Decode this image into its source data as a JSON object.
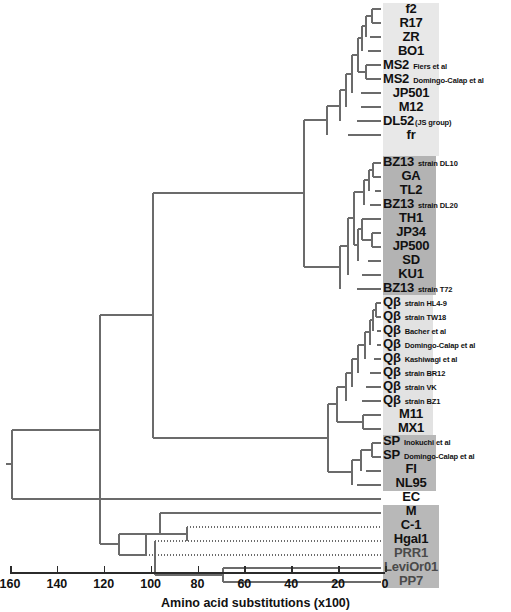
{
  "figure": {
    "type": "phylogenetic-tree-dendrogram",
    "background": "#ffffff",
    "branch_color": "#6b6b6b",
    "axis_color": "#2b2b2b"
  },
  "axis": {
    "title": "Amino acid substitutions (x100)",
    "ticks": [
      "160",
      "140",
      "120",
      "100",
      "80",
      "60",
      "40",
      "20",
      "0"
    ],
    "tick_values": [
      160,
      140,
      120,
      100,
      80,
      60,
      40,
      20,
      0
    ],
    "min": 0,
    "max": 160,
    "direction": "right-to-left",
    "px_left": 10,
    "px_right": 385
  },
  "groups": [
    {
      "id": "group-ms2",
      "shade": "#e8e8e8",
      "first_row": 0,
      "last_row": 10,
      "left": 383,
      "width": 56
    },
    {
      "id": "group-ga",
      "shade": "#b3b3b3",
      "first_row": 11,
      "last_row": 20,
      "left": 383,
      "width": 53
    },
    {
      "id": "group-qbeta",
      "shade": "#e2e2e2",
      "first_row": 21,
      "last_row": 30,
      "left": 383,
      "width": 50
    },
    {
      "id": "group-sp",
      "shade": "#b8b8b8",
      "first_row": 31,
      "last_row": 34,
      "left": 383,
      "width": 53
    },
    {
      "id": "group-misc",
      "shade": "#b8b8b8",
      "first_row": 36,
      "last_row": 41,
      "left": 383,
      "width": 56
    }
  ],
  "taxa": [
    {
      "name": "f2",
      "sub": ""
    },
    {
      "name": "R17",
      "sub": ""
    },
    {
      "name": "ZR",
      "sub": ""
    },
    {
      "name": "BO1",
      "sub": ""
    },
    {
      "name": "MS2",
      "sub": "Fiers et al"
    },
    {
      "name": "MS2",
      "sub": "Domingo-Calap et al"
    },
    {
      "name": "JP501",
      "sub": ""
    },
    {
      "name": "M12",
      "sub": ""
    },
    {
      "name": "DL52",
      "sub": "(JS group)"
    },
    {
      "name": "fr",
      "sub": ""
    },
    {
      "name": "",
      "sub": ""
    },
    {
      "name": "BZ13",
      "sub": "strain DL10"
    },
    {
      "name": "GA",
      "sub": ""
    },
    {
      "name": "TL2",
      "sub": ""
    },
    {
      "name": "BZ13",
      "sub": "strain DL20"
    },
    {
      "name": "TH1",
      "sub": ""
    },
    {
      "name": "JP34",
      "sub": ""
    },
    {
      "name": "JP500",
      "sub": ""
    },
    {
      "name": "SD",
      "sub": ""
    },
    {
      "name": "KU1",
      "sub": ""
    },
    {
      "name": "BZ13",
      "sub": "strain T72"
    },
    {
      "name": "Qβ",
      "sub": "strain HL4-9"
    },
    {
      "name": "Qβ",
      "sub": "strain TW18"
    },
    {
      "name": "Qβ",
      "sub": "Bacher et al"
    },
    {
      "name": "Qβ",
      "sub": "Domingo-Calap et al"
    },
    {
      "name": "Qβ",
      "sub": "Kashiwagi et al"
    },
    {
      "name": "Qβ",
      "sub": "strain BR12"
    },
    {
      "name": "Qβ",
      "sub": "strain VK"
    },
    {
      "name": "Qβ",
      "sub": "strain BZ1"
    },
    {
      "name": "M11",
      "sub": ""
    },
    {
      "name": "MX1",
      "sub": ""
    },
    {
      "name": "SP",
      "sub": "Inokuchi et al"
    },
    {
      "name": "SP",
      "sub": "Domingo-Calap et al"
    },
    {
      "name": "FI",
      "sub": ""
    },
    {
      "name": "NL95",
      "sub": ""
    },
    {
      "name": "EC",
      "sub": ""
    },
    {
      "name": "M",
      "sub": ""
    },
    {
      "name": "C-1",
      "sub": ""
    },
    {
      "name": "Hgal1",
      "sub": ""
    },
    {
      "name": "PRR1",
      "sub": "",
      "dim": true
    },
    {
      "name": "LeviOr01",
      "sub": "",
      "dim": true
    },
    {
      "name": "PP7",
      "sub": "",
      "dim": true
    }
  ],
  "chart_data": {
    "type": "tree",
    "title": "",
    "xlabel": "Amino acid substitutions (x100)",
    "ylabel": "",
    "xlim": [
      160,
      0
    ],
    "grid": false,
    "legend": "none",
    "leaf_order": [
      "f2",
      "R17",
      "ZR",
      "BO1",
      "MS2 Fiers et al",
      "MS2 Domingo-Calap et al",
      "JP501",
      "M12",
      "DL52 (JS group)",
      "fr",
      "BZ13 strain DL10",
      "GA",
      "TL2",
      "BZ13 strain DL20",
      "TH1",
      "JP34",
      "JP500",
      "SD",
      "KU1",
      "BZ13 strain T72",
      "Qβ strain HL4-9",
      "Qβ strain TW18",
      "Qβ Bacher et al",
      "Qβ Domingo-Calap et al",
      "Qβ Kashiwagi et al",
      "Qβ strain BR12",
      "Qβ strain VK",
      "Qβ strain BZ1",
      "M11",
      "MX1",
      "SP Inokuchi et al",
      "SP Domingo-Calap et al",
      "FI",
      "NL95",
      "EC",
      "M",
      "C-1",
      "Hgal1",
      "PRR1",
      "LeviOr01",
      "PP7"
    ],
    "leaf_branch_lengths_units": [
      2,
      2,
      2,
      2,
      3,
      3,
      5,
      5,
      6,
      11,
      2,
      2,
      2,
      4,
      5,
      5,
      5,
      5,
      7,
      9,
      1,
      1,
      1,
      1,
      2,
      3,
      4,
      5,
      9,
      11,
      3,
      3,
      6,
      11,
      157,
      155,
      152,
      151,
      149,
      49,
      49
    ],
    "internal_node_depths_units": [
      160,
      152,
      100,
      75,
      62,
      46,
      30,
      22,
      18,
      14,
      11,
      9,
      7,
      5,
      3,
      2
    ]
  }
}
